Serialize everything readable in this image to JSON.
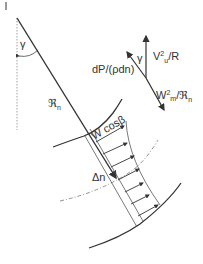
{
  "diagram": {
    "type": "streamline-curvature-force-balance",
    "labels": {
      "angle": "γ",
      "radius": "ℜ",
      "radius_sub": "n",
      "pressure_gradient": "dP/(ρdn)",
      "gamma_force": "γ",
      "centrifugal_u": "V",
      "centrifugal_u_sup": "2",
      "centrifugal_u_sub": "u",
      "centrifugal_u_tail": "/R",
      "meridional": "W",
      "meridional_sup": "2",
      "meridional_sub": "m",
      "meridional_tail": "/ℜ",
      "meridional_tail_sub": "n",
      "velocity_component": "W cosβ",
      "delta_n": "Δn"
    },
    "colors": {
      "line": "#333333",
      "thin_line": "#555555",
      "dashed": "#777777",
      "background": "#ffffff"
    }
  }
}
